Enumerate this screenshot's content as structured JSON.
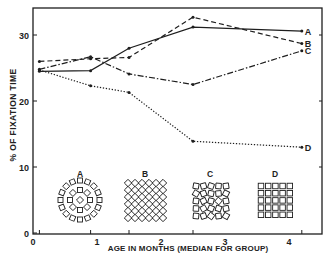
{
  "chart_data": {
    "type": "line",
    "title": "",
    "xlabel": "AGE IN MONTHS (MEDIAN FOR GROUP)",
    "ylabel": "% OF FIXATION TIME",
    "xlim": [
      0,
      4.5
    ],
    "ylim": [
      0,
      34
    ],
    "x_ticks": [
      "0",
      "1",
      "2",
      "3",
      "4"
    ],
    "y_ticks": [
      "0",
      "10",
      "20",
      "30"
    ],
    "grid": false,
    "legend": "direct labels at line ends (A, B, C, D)",
    "x": [
      0.1,
      0.9,
      1.5,
      2.5,
      4.2
    ],
    "series": [
      {
        "name": "A",
        "style": "solid",
        "values": [
          24.5,
          24.6,
          28.0,
          31.2,
          30.6
        ]
      },
      {
        "name": "B",
        "style": "dashed",
        "values": [
          26.0,
          26.4,
          26.6,
          32.7,
          28.7
        ]
      },
      {
        "name": "C",
        "style": "dash-dot",
        "values": [
          24.8,
          26.7,
          24.1,
          22.5,
          27.6
        ]
      },
      {
        "name": "D",
        "style": "dotted",
        "values": [
          24.7,
          22.3,
          21.3,
          13.9,
          13.0
        ]
      }
    ],
    "annotations": [
      {
        "label": "A",
        "description": "concentric rings of squares (bull's-eye pattern)"
      },
      {
        "label": "B",
        "description": "lattice of diamonds"
      },
      {
        "label": "C",
        "description": "irregular/randomly rotated squares"
      },
      {
        "label": "D",
        "description": "regular grid of squares"
      }
    ]
  }
}
